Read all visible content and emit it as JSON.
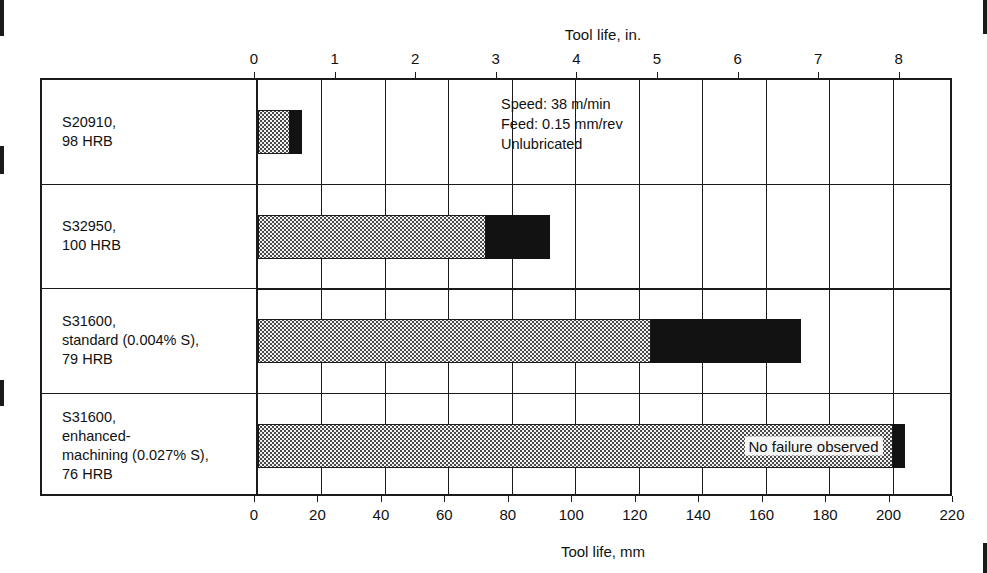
{
  "chart_data": {
    "type": "bar",
    "orientation": "horizontal",
    "stacked": true,
    "title": "",
    "top_axis": {
      "label": "Tool life, in.",
      "ticks": [
        0,
        1,
        2,
        3,
        4,
        5,
        6,
        7,
        8
      ],
      "range": [
        0,
        8.661
      ],
      "unit": "in."
    },
    "bottom_axis": {
      "label": "Tool life, mm",
      "ticks": [
        0,
        20,
        40,
        60,
        80,
        100,
        120,
        140,
        160,
        180,
        200,
        220
      ],
      "range": [
        0,
        220
      ],
      "unit": "mm"
    },
    "ylabel": "",
    "grid": true,
    "legend_position": "none",
    "categories": [
      "S20910,\n98 HRB",
      "S32950,\n100 HRB",
      "S31600,\nstandard (0.004% S),\n79 HRB",
      "S31600,\nenhanced-\nmachining (0.027% S),\n76 HRB"
    ],
    "series": [
      {
        "name": "stippled-segment",
        "fill": "stipple",
        "values": [
          10,
          72,
          124,
          200
        ]
      },
      {
        "name": "solid-segment",
        "fill": "solid",
        "values": [
          4,
          20,
          47,
          4
        ]
      }
    ],
    "totals_mm": [
      14,
      92,
      171,
      204
    ],
    "totals_in": [
      0.55,
      3.62,
      6.73,
      8.03
    ],
    "annotations": [
      {
        "text": "No failure observed",
        "category_index": 3
      }
    ],
    "conditions": "Speed: 38 m/min\nFeed: 0.15 mm/rev\nUnlubricated",
    "colors": {
      "stipple_fill": "#f2f2f2",
      "stipple_dot": "#4a4a4a",
      "solid_fill": "#121212",
      "axis": "#1b1b1b",
      "background": "#ffffff"
    }
  }
}
